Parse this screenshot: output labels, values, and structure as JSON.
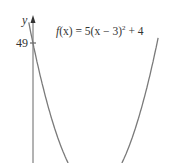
{
  "chart_data": {
    "type": "line",
    "function": "f(x) = 5(x - 3)^2 + 4",
    "xlabel": "",
    "ylabel": "y",
    "y_ticks": [
      49
    ],
    "y_tick_labels": [
      "49"
    ],
    "grid": false,
    "legend": null,
    "x": [
      -0.2,
      0,
      1,
      2,
      3,
      4,
      5,
      6,
      6.1
    ],
    "values": [
      55.2,
      49,
      24,
      9,
      4,
      9,
      24,
      49,
      52.05
    ],
    "annotations": [
      {
        "text": "f(x) = 5(x − 3)² + 4",
        "position": "top-center"
      }
    ],
    "colors": {
      "curve": "#777777",
      "axis": "#555555",
      "text": "#333333"
    }
  },
  "labels": {
    "y_axis": "y",
    "tick_49": "49",
    "equation_f": "f",
    "equation_rest": "(x) = 5(x − 3)",
    "equation_exp": "2",
    "equation_tail": " + 4"
  }
}
